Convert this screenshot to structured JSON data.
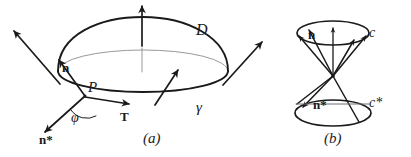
{
  "figure": {
    "kind": "mathematical-diagram",
    "stroke_color": "#1a1a1a",
    "faint_stroke_color": "#8d8d8d",
    "background": "#ffffff"
  },
  "panel_a": {
    "caption": "(a)",
    "labels": {
      "surface": "D",
      "boundary_curve": "γ",
      "normal": "n",
      "point": "P",
      "angle": "φ",
      "tangent": "T",
      "conormal": "n*"
    },
    "elements": {
      "cap_name": "surface-cap-D",
      "rim_name": "boundary-curve-gamma",
      "disk_edge_name": "flat-disk-edge",
      "normal_vectors": 4,
      "labelled_point": "P"
    }
  },
  "panel_b": {
    "caption": "(b)",
    "labels": {
      "upper_cone": "c",
      "lower_cone": "c*",
      "normal": "n",
      "conormal": "n*"
    },
    "elements": {
      "upper_cone_name": "normal-cone-c",
      "lower_cone_name": "dual-cone-c-star",
      "apex_name": "cone-apex",
      "upper_generators": 5,
      "lower_generators": 3
    }
  }
}
